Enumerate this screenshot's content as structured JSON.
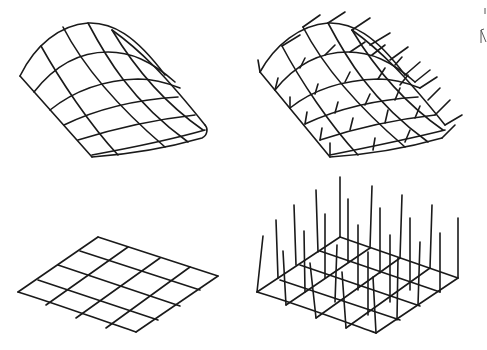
{
  "figure": {
    "stroke_color": "#1a1a1a",
    "background": "#ffffff"
  },
  "panels": [
    {
      "id": "top-left",
      "label": "",
      "type": "curved-mesh"
    },
    {
      "id": "top-right",
      "label": "",
      "type": "curved-mesh-with-normals"
    },
    {
      "id": "bottom-left",
      "label": "",
      "type": "flat-grid-4x4"
    },
    {
      "id": "bottom-right",
      "label": "",
      "type": "flat-grid-with-vertical-vectors"
    }
  ]
}
